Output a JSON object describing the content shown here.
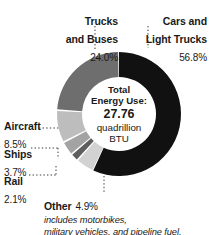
{
  "chart_data": {
    "type": "pie",
    "variant": "donut",
    "title": "",
    "center_text": {
      "line1": "Total",
      "line2": "Energy Use:",
      "value": "27.76",
      "unit_line1": "quadrillion",
      "unit_line2": "BTU"
    },
    "total_value": 27.76,
    "total_unit": "quadrillion BTU",
    "categories": [
      "Cars and Light Trucks",
      "Trucks and Buses",
      "Aircraft",
      "Other",
      "Ships",
      "Rail"
    ],
    "values": [
      56.8,
      24.0,
      8.5,
      4.9,
      3.7,
      2.1
    ],
    "value_suffix": "%",
    "slices": [
      {
        "label_line1": "Cars and",
        "label_line2": "Light Trucks",
        "label_full": "Cars and Light Trucks",
        "value": 56.8,
        "value_text": "56.8%",
        "color": "#111111"
      },
      {
        "label_line1": "Trucks",
        "label_line2": "and Buses",
        "label_full": "Trucks and Buses",
        "value": 24.0,
        "value_text": "24.0%",
        "color": "#6e6e6e"
      },
      {
        "label_line1": "Aircraft",
        "label_full": "Aircraft",
        "value": 8.5,
        "value_text": "8.5%",
        "color": "#bdbdbd"
      },
      {
        "label_line1": "Ships",
        "label_full": "Ships",
        "value": 3.7,
        "value_text": "3.7%",
        "color": "#a3a3a3"
      },
      {
        "label_line1": "Rail",
        "label_full": "Rail",
        "value": 2.1,
        "value_text": "2.1%",
        "color": "#5e5e5e"
      },
      {
        "label_line1": "Other",
        "label_full": "Other",
        "value": 4.9,
        "value_text": "4.9%",
        "color": "#d2d2d2",
        "note": "includes motorbikes, military vehicles, and pipeline fuel."
      }
    ],
    "footnote_line1": "includes motorbikes,",
    "footnote_line2": "military vehicles, and pipeline fuel.",
    "legend": "none",
    "grid": false,
    "background": "#ffffff",
    "text_color": "#1a1a1a"
  }
}
